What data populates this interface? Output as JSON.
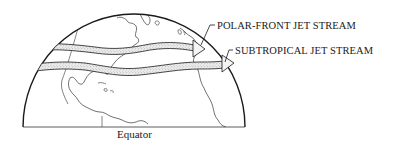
{
  "diagram": {
    "type": "hemisphere-map",
    "labels": {
      "polar_front": "POLAR-FRONT JET STREAM",
      "subtropical": "SUBTROPICAL JET STREAM",
      "equator": "Equator"
    },
    "colors": {
      "line": "#1a1a1a",
      "band_fill": "#e6e6e6",
      "band_stipple": "#8a8a8a",
      "background": "#ffffff"
    }
  }
}
